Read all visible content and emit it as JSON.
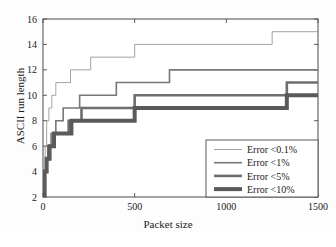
{
  "figure": {
    "background_color": "#fdfdfd",
    "axes_color": "#4a4a4a",
    "text_color": "#1a1a1a"
  },
  "chart_data": {
    "type": "line",
    "subtype": "step",
    "title": "",
    "xlabel": "Packet size",
    "ylabel": "ASCII run length",
    "xlim": [
      0,
      1500
    ],
    "ylim": [
      2,
      16
    ],
    "xticks": [
      0,
      500,
      1000,
      1500
    ],
    "xticklabels": [
      "0",
      "500",
      "1000",
      "1500"
    ],
    "yticks": [
      2,
      4,
      6,
      8,
      10,
      12,
      14,
      16
    ],
    "yticklabels": [
      "2",
      "4",
      "6",
      "8",
      "10",
      "12",
      "14",
      "16"
    ],
    "grid": false,
    "legend_position": "lower right",
    "series": [
      {
        "name": "Error <0.1%",
        "color": "#8c8c8c",
        "linewidth": 0.8,
        "x": [
          2,
          6,
          12,
          20,
          32,
          48,
          70,
          100,
          150,
          260,
          500,
          1250,
          1500
        ],
        "y": [
          2,
          4,
          6,
          8,
          9,
          10,
          11,
          11,
          12,
          13,
          14,
          15,
          15
        ]
      },
      {
        "name": "Error <1%",
        "color": "#777777",
        "linewidth": 1.6,
        "x": [
          2,
          6,
          14,
          26,
          44,
          70,
          110,
          200,
          250,
          400,
          690,
          1500
        ],
        "y": [
          2,
          4,
          5,
          6,
          7,
          8,
          9,
          10,
          10,
          11,
          12,
          12
        ]
      },
      {
        "name": "Error <5%",
        "color": "#6e6e6e",
        "linewidth": 2.6,
        "x": [
          2,
          8,
          18,
          32,
          55,
          95,
          140,
          210,
          390,
          500,
          1040,
          1330,
          1500
        ],
        "y": [
          2,
          4,
          5,
          6,
          7,
          7,
          8,
          9,
          9,
          10,
          10,
          11,
          11
        ]
      },
      {
        "name": "Error <10%",
        "color": "#5a5a5a",
        "linewidth": 4.0,
        "x": [
          2,
          9,
          20,
          36,
          60,
          100,
          155,
          400,
          500,
          1040,
          1330,
          1500
        ],
        "y": [
          2,
          4,
          5,
          6,
          7,
          7,
          8,
          8,
          9,
          9,
          10,
          10
        ]
      }
    ]
  },
  "legend": {
    "entries": [
      {
        "label": "Error <0.1%"
      },
      {
        "label": "Error <1%"
      },
      {
        "label": "Error <5%"
      },
      {
        "label": "Error <10%"
      }
    ]
  }
}
